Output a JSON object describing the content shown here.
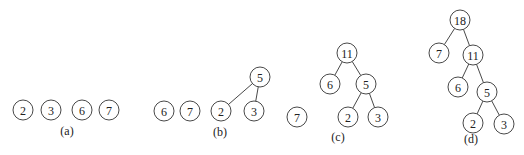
{
  "figure": {
    "panels": [
      {
        "caption": "(a)",
        "caption_pos": [
          67,
          135
        ],
        "nodes": [
          {
            "id": "a2",
            "label": "2",
            "x": 23,
            "y": 110
          },
          {
            "id": "a3",
            "label": "3",
            "x": 51,
            "y": 110
          },
          {
            "id": "a6",
            "label": "6",
            "x": 82,
            "y": 110
          },
          {
            "id": "a7",
            "label": "7",
            "x": 109,
            "y": 110
          }
        ],
        "edges": []
      },
      {
        "caption": "(b)",
        "caption_pos": [
          220,
          136
        ],
        "nodes": [
          {
            "id": "b5",
            "label": "5",
            "x": 260,
            "y": 77
          },
          {
            "id": "b6",
            "label": "6",
            "x": 164,
            "y": 111
          },
          {
            "id": "b7",
            "label": "7",
            "x": 190,
            "y": 111
          },
          {
            "id": "b2",
            "label": "2",
            "x": 221,
            "y": 111
          },
          {
            "id": "b3",
            "label": "3",
            "x": 254,
            "y": 111
          }
        ],
        "edges": [
          [
            "b5",
            "b2"
          ],
          [
            "b5",
            "b3"
          ]
        ]
      },
      {
        "caption": "(c)",
        "caption_pos": [
          338,
          141
        ],
        "nodes": [
          {
            "id": "c11",
            "label": "11",
            "x": 347,
            "y": 53
          },
          {
            "id": "c6",
            "label": "6",
            "x": 330,
            "y": 84
          },
          {
            "id": "c5",
            "label": "5",
            "x": 366,
            "y": 84
          },
          {
            "id": "c7",
            "label": "7",
            "x": 297,
            "y": 117
          },
          {
            "id": "c2",
            "label": "2",
            "x": 348,
            "y": 117
          },
          {
            "id": "c3",
            "label": "3",
            "x": 378,
            "y": 117
          }
        ],
        "edges": [
          [
            "c11",
            "c6"
          ],
          [
            "c11",
            "c5"
          ],
          [
            "c5",
            "c2"
          ],
          [
            "c5",
            "c3"
          ]
        ]
      },
      {
        "caption": "(d)",
        "caption_pos": [
          471,
          143
        ],
        "nodes": [
          {
            "id": "d18",
            "label": "18",
            "x": 460,
            "y": 20
          },
          {
            "id": "d7",
            "label": "7",
            "x": 439,
            "y": 53
          },
          {
            "id": "d11",
            "label": "11",
            "x": 473,
            "y": 55
          },
          {
            "id": "d6",
            "label": "6",
            "x": 458,
            "y": 87
          },
          {
            "id": "d5",
            "label": "5",
            "x": 487,
            "y": 92
          },
          {
            "id": "d2",
            "label": "2",
            "x": 473,
            "y": 123
          },
          {
            "id": "d3",
            "label": "3",
            "x": 504,
            "y": 124
          }
        ],
        "edges": [
          [
            "d18",
            "d7"
          ],
          [
            "d18",
            "d11"
          ],
          [
            "d11",
            "d6"
          ],
          [
            "d11",
            "d5"
          ],
          [
            "d5",
            "d2"
          ],
          [
            "d5",
            "d3"
          ]
        ]
      }
    ],
    "node_radius": 10
  }
}
